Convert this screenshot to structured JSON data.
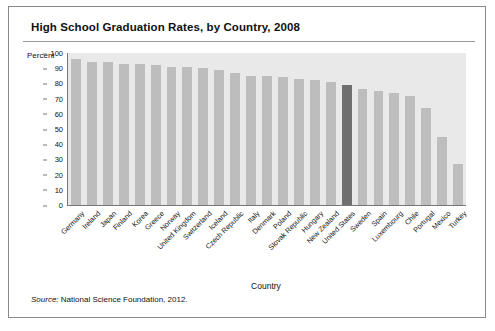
{
  "card": {
    "title": "High School Graduation Rates, by Country, 2008",
    "source_prefix": "Source:",
    "source_text": " National Science Foundation, 2012."
  },
  "chart_data": {
    "type": "bar",
    "title": "High School Graduation Rates, by Country, 2008",
    "xlabel": "Country",
    "ylabel": "Percent",
    "ylim": [
      0,
      100
    ],
    "yticks": [
      0,
      10,
      20,
      30,
      40,
      50,
      60,
      70,
      80,
      90,
      100
    ],
    "grid": false,
    "legend": "none",
    "highlight_category": "United States",
    "highlight_color": "#6f6f6f",
    "bar_color": "#bdbdbd",
    "plot_background": "#e9e9e9",
    "categories": [
      "Germany",
      "Ireland",
      "Japan",
      "Finland",
      "Korea",
      "Greece",
      "Norway",
      "United Kingdom",
      "Switzerland",
      "Iceland",
      "Czech Republic",
      "Italy",
      "Denmark",
      "Poland",
      "Slovak Republic",
      "Hungary",
      "New Zealand",
      "United States",
      "Sweden",
      "Spain",
      "Luxembourg",
      "Chile",
      "Portugal",
      "Mexico",
      "Turkey"
    ],
    "values": [
      96,
      94,
      94,
      93,
      93,
      92,
      91,
      91,
      90,
      89,
      87,
      85,
      85,
      84,
      83,
      82,
      81,
      79,
      76,
      75,
      74,
      72,
      64,
      45,
      27
    ]
  }
}
